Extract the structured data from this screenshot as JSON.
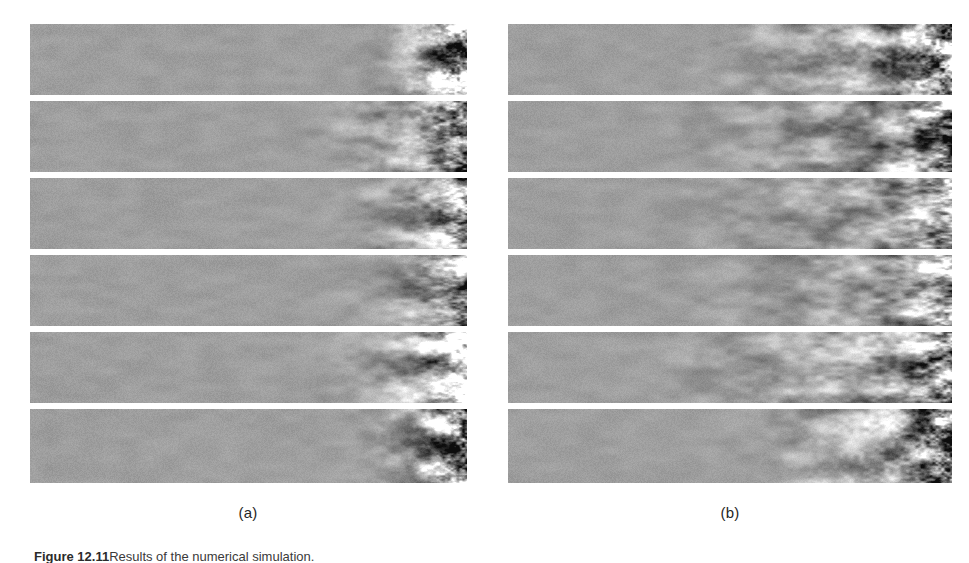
{
  "figure": {
    "caption_label": "Figure 12.11",
    "caption_text": "Results of the numerical simulation.",
    "background_color": "#ffffff",
    "base_gray": "#9a9a9a"
  },
  "panels": [
    {
      "id": "a",
      "sub_caption": "(a)",
      "x": 30,
      "y": 24,
      "width": 437,
      "height": 459,
      "strip_count": 6,
      "chaos_onset_fraction": 0.63,
      "seed": 1201
    },
    {
      "id": "b",
      "sub_caption": "(b)",
      "x": 508,
      "y": 24,
      "width": 444,
      "height": 459,
      "strip_count": 6,
      "chaos_onset_fraction": 0.3,
      "seed": 7734
    }
  ],
  "chart_data": {
    "type": "heatmap",
    "title": "",
    "xlabel": "",
    "ylabel": "",
    "colormap": "grayscale",
    "panel_labels": [
      "(a)",
      "(b)"
    ],
    "rows_per_panel": 6,
    "panel_a": {
      "label": "(a)",
      "strips": [
        {
          "index": 1,
          "y": 0,
          "height": 71,
          "onset_fraction": 0.7,
          "roughness": 0.95,
          "amplitude": 1.0
        },
        {
          "index": 2,
          "y": 77,
          "height": 71,
          "onset_fraction": 0.55,
          "roughness": 0.7,
          "amplitude": 0.9
        },
        {
          "index": 3,
          "y": 154,
          "height": 71,
          "onset_fraction": 0.6,
          "roughness": 0.55,
          "amplitude": 0.75
        },
        {
          "index": 4,
          "y": 231,
          "height": 71,
          "onset_fraction": 0.62,
          "roughness": 0.5,
          "amplitude": 0.7
        },
        {
          "index": 5,
          "y": 308,
          "height": 71,
          "onset_fraction": 0.58,
          "roughness": 0.65,
          "amplitude": 0.85
        },
        {
          "index": 6,
          "y": 385,
          "height": 74,
          "onset_fraction": 0.66,
          "roughness": 0.9,
          "amplitude": 1.0
        }
      ]
    },
    "panel_b": {
      "label": "(b)",
      "strips": [
        {
          "index": 1,
          "y": 0,
          "height": 71,
          "onset_fraction": 0.3,
          "roughness": 0.95,
          "amplitude": 1.0
        },
        {
          "index": 2,
          "y": 77,
          "height": 71,
          "onset_fraction": 0.22,
          "roughness": 0.6,
          "amplitude": 0.85
        },
        {
          "index": 3,
          "y": 154,
          "height": 71,
          "onset_fraction": 0.18,
          "roughness": 0.45,
          "amplitude": 0.7
        },
        {
          "index": 4,
          "y": 231,
          "height": 71,
          "onset_fraction": 0.2,
          "roughness": 0.45,
          "amplitude": 0.7
        },
        {
          "index": 5,
          "y": 308,
          "height": 71,
          "onset_fraction": 0.15,
          "roughness": 0.6,
          "amplitude": 0.85
        },
        {
          "index": 6,
          "y": 385,
          "height": 74,
          "onset_fraction": 0.4,
          "roughness": 0.9,
          "amplitude": 1.0
        }
      ]
    }
  }
}
